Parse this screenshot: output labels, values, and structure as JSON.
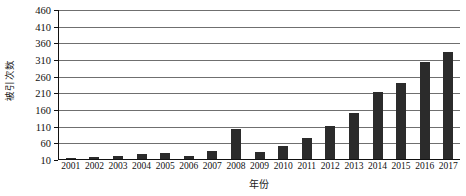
{
  "chart_data": {
    "type": "bar",
    "title": "",
    "xlabel": "年份",
    "ylabel": "被引次数",
    "categories": [
      "2001",
      "2002",
      "2003",
      "2004",
      "2005",
      "2006",
      "2007",
      "2008",
      "2009",
      "2010",
      "2011",
      "2012",
      "2013",
      "2014",
      "2015",
      "2016",
      "2017"
    ],
    "values": [
      14,
      15,
      20,
      26,
      28,
      20,
      33,
      100,
      32,
      49,
      72,
      108,
      148,
      210,
      238,
      300,
      330
    ],
    "ylim": [
      10,
      460
    ],
    "yticks": [
      10,
      60,
      110,
      160,
      210,
      260,
      310,
      360,
      410,
      460
    ],
    "ytick_labels": [
      "10",
      "60",
      "110",
      "160",
      "210",
      "260",
      "310",
      "360",
      "410",
      "460"
    ],
    "grid": true,
    "legend": "none",
    "bar_color": "#2b2b2b",
    "gridline_color": "#6f6f6f",
    "axis_color": "#111111",
    "background_color": "#ffffff"
  }
}
